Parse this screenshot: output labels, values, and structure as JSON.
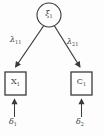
{
  "diagram": {
    "kind": "sem-path-diagram",
    "latent": {
      "base": "ξ",
      "sub": "1"
    },
    "loadings": {
      "left": {
        "base": "λ",
        "sub": "11"
      },
      "right": {
        "base": "λ",
        "sub": "21"
      }
    },
    "indicators": {
      "left": {
        "base": "X",
        "sub": "1"
      },
      "right": {
        "base": "C",
        "sub": "1"
      }
    },
    "errors": {
      "left": {
        "base": "δ",
        "sub": "1"
      },
      "right": {
        "base": "δ",
        "sub": "2"
      }
    }
  },
  "colors": {
    "ink": "#3b3b3b",
    "paper": "#fdfdfd"
  }
}
